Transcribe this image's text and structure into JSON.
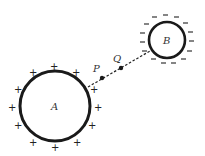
{
  "diagram": {
    "sphere_a": {
      "label": "A",
      "charge": "+",
      "cx": 55,
      "cy": 106,
      "r": 35
    },
    "sphere_b": {
      "label": "B",
      "charge": "−",
      "cx": 167,
      "cy": 40,
      "r": 18
    },
    "point_p": {
      "label": "P",
      "x": 102,
      "y": 78
    },
    "point_q": {
      "label": "Q",
      "x": 121,
      "y": 68
    },
    "line_color": "#222222"
  }
}
